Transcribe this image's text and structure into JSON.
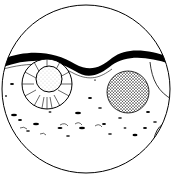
{
  "figure": {
    "kind": "microscope-field-illustration",
    "colors": {
      "ink": "#000000",
      "background": "#ffffff"
    },
    "elements": [
      {
        "name": "field-circle"
      },
      {
        "name": "wavy-band"
      },
      {
        "name": "radiating-cell"
      },
      {
        "name": "stippled-sphere"
      },
      {
        "name": "curved-line-right"
      },
      {
        "name": "edge-ellipse-right"
      },
      {
        "name": "scattered-particles"
      }
    ]
  }
}
